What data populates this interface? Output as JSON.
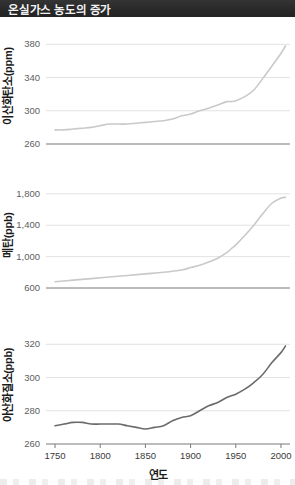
{
  "title_bar": {
    "title": "온실가스 농도의 증가"
  },
  "x_axis": {
    "label": "연도",
    "ticks": [
      1750,
      1800,
      1850,
      1900,
      1950,
      2000
    ],
    "tick_labels": [
      "1750",
      "1800",
      "1850",
      "1900",
      "1950",
      "2000"
    ],
    "range": [
      1740,
      2010
    ]
  },
  "chart_data": [
    {
      "id": "co2",
      "type": "line",
      "title": "",
      "ylabel": "이산화탄소(ppm)",
      "xlabel": "",
      "units": "ppm",
      "ylim": [
        260,
        390
      ],
      "yticks": [
        260,
        300,
        340,
        380
      ],
      "ytick_labels": [
        "260",
        "300",
        "340",
        "380"
      ],
      "grid": true,
      "legend": "none",
      "line_color": "#c9c9c9",
      "x": [
        1750,
        1760,
        1770,
        1780,
        1790,
        1800,
        1810,
        1820,
        1830,
        1840,
        1850,
        1860,
        1870,
        1880,
        1890,
        1900,
        1910,
        1920,
        1930,
        1940,
        1945,
        1950,
        1960,
        1970,
        1980,
        1990,
        2000,
        2005
      ],
      "values": [
        277,
        277,
        278,
        279,
        280,
        282,
        284,
        284,
        284,
        285,
        286,
        287,
        288,
        290,
        294,
        296,
        300,
        303,
        307,
        311,
        311,
        312,
        317,
        325,
        339,
        354,
        369,
        378
      ]
    },
    {
      "id": "ch4",
      "type": "line",
      "title": "",
      "ylabel": "메탄(ppb)",
      "xlabel": "",
      "units": "ppb",
      "ylim": [
        600,
        1900
      ],
      "yticks": [
        600,
        1000,
        1400,
        1800
      ],
      "ytick_labels": [
        "600",
        "1,000",
        "1,400",
        "1,800"
      ],
      "grid": true,
      "legend": "none",
      "line_color": "#c9c9c9",
      "x": [
        1750,
        1770,
        1790,
        1810,
        1830,
        1850,
        1870,
        1890,
        1900,
        1910,
        1920,
        1930,
        1940,
        1945,
        1950,
        1960,
        1970,
        1980,
        1990,
        2000,
        2005
      ],
      "values": [
        680,
        700,
        720,
        740,
        760,
        780,
        800,
        830,
        860,
        890,
        930,
        980,
        1050,
        1100,
        1150,
        1270,
        1400,
        1550,
        1680,
        1745,
        1755
      ]
    },
    {
      "id": "n2o",
      "type": "line",
      "title": "",
      "ylabel": "아산화질소(ppb)",
      "xlabel": "연도",
      "units": "ppb",
      "ylim": [
        260,
        325
      ],
      "yticks": [
        260,
        280,
        300,
        320
      ],
      "ytick_labels": [
        "260",
        "280",
        "300",
        "320"
      ],
      "grid": true,
      "legend": "none",
      "line_color": "#6b6b6b",
      "x": [
        1750,
        1760,
        1770,
        1780,
        1790,
        1800,
        1810,
        1820,
        1830,
        1840,
        1850,
        1860,
        1870,
        1880,
        1890,
        1900,
        1910,
        1920,
        1930,
        1940,
        1950,
        1960,
        1970,
        1980,
        1990,
        2000,
        2005
      ],
      "values": [
        271,
        272,
        273,
        273,
        272,
        272,
        272,
        272,
        271,
        270,
        269,
        270,
        271,
        274,
        276,
        277,
        280,
        283,
        285,
        288,
        290,
        293,
        297,
        302,
        309,
        315,
        319
      ]
    }
  ]
}
